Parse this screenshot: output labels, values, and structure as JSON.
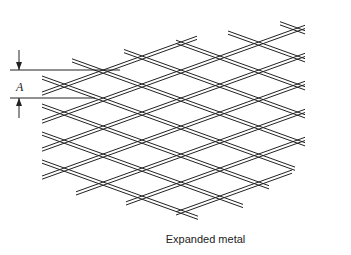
{
  "figure": {
    "caption": "Expanded metal",
    "dimension_label": "A"
  },
  "colors": {
    "line": "#222222",
    "background": "#ffffff"
  }
}
